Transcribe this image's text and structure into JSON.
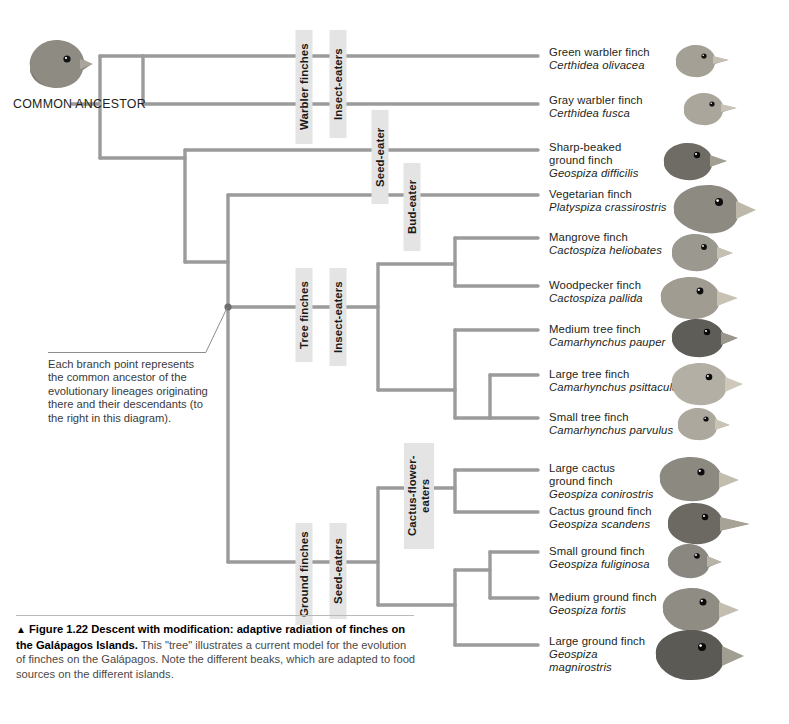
{
  "figure": {
    "ancestor_label": "COMMON\nANCESTOR",
    "annotation": "Each branch point represents the common ancestor of the evolutionary lineages originating there and their descendants (to the right in this diagram).",
    "caption_marker": "▲",
    "caption_bold": "Figure 1.22 Descent with modification: adaptive radiation of finches on the Galápagos Islands.",
    "caption_rest": " This \"tree\" illustrates a current model for the evolution of finches on the Galápagos. Note the different beaks, which are adapted to food sources on the different islands."
  },
  "clades": {
    "warbler_finches": "Warbler finches",
    "insect_eaters_top": "Insect-eaters",
    "seed_eater": "Seed-eater",
    "bud_eater": "Bud-eater",
    "tree_finches": "Tree finches",
    "insect_eaters_tree": "Insect-eaters",
    "ground_finches": "Ground finches",
    "seed_eaters": "Seed-eaters",
    "cactus_flower_eaters": "Cactus-flower-\neaters"
  },
  "species": [
    {
      "common": "Green warbler finch",
      "scientific": "Certhidea olivacea"
    },
    {
      "common": "Gray warbler finch",
      "scientific": "Certhidea fusca"
    },
    {
      "common": "Sharp-beaked\nground finch",
      "scientific": "Geospiza difficilis"
    },
    {
      "common": "Vegetarian finch",
      "scientific": "Platyspiza crassirostris"
    },
    {
      "common": "Mangrove finch",
      "scientific": "Cactospiza heliobates"
    },
    {
      "common": "Woodpecker finch",
      "scientific": "Cactospiza pallida"
    },
    {
      "common": "Medium tree finch",
      "scientific": "Camarhynchus pauper"
    },
    {
      "common": "Large tree finch",
      "scientific": "Camarhynchus psittacula"
    },
    {
      "common": "Small tree finch",
      "scientific": "Camarhynchus parvulus"
    },
    {
      "common": "Large cactus\nground finch",
      "scientific": "Geospiza conirostris"
    },
    {
      "common": "Cactus ground finch",
      "scientific": "Geospiza scandens"
    },
    {
      "common": "Small ground finch",
      "scientific": "Geospiza fuliginosa"
    },
    {
      "common": "Medium ground finch",
      "scientific": "Geospiza fortis"
    },
    {
      "common": "Large ground finch",
      "scientific": "Geospiza\nmagnirostris"
    }
  ],
  "colors": {
    "branch": "#9b9b9b",
    "label_bg": "#e4e4e4",
    "text": "#231f20",
    "bird_body": "#8e8b82",
    "bird_beak": "#c9c4b6",
    "background": "#ffffff"
  }
}
